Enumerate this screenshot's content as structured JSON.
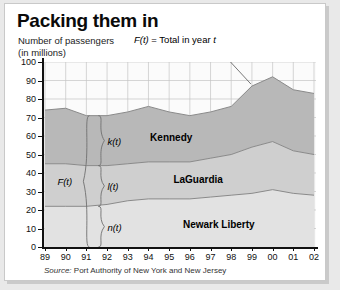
{
  "card": {
    "title": "Packing them in",
    "subtitle_line1": "Number of passengers",
    "subtitle_line2": "(in millions)",
    "callout": "= Total in year",
    "callout_fn": "F(t)",
    "callout_var": "t",
    "source_prefix": "Source:",
    "source_text": "Port Authority of New York and New Jersey"
  },
  "annotations": {
    "brace_total": "F(t)",
    "brace_kennedy": "k(t)",
    "brace_laguardia": "l(t)",
    "brace_newark": "n(t)"
  },
  "colors": {
    "kennedy": "#b8b8b8",
    "laguardia": "#cfcfcf",
    "newark": "#e2e2e2",
    "curve": "#8a8a8a",
    "grid": "#c4c4c4",
    "axis": "#111111",
    "card_bg": "#ffffff",
    "page_bg": "#e9e9e9"
  },
  "chart_data": {
    "type": "area",
    "stacked": true,
    "title": "Packing them in",
    "xlabel": "",
    "ylabel": "Number of passengers (in millions)",
    "ylim": [
      0,
      100
    ],
    "yticks": [
      0,
      10,
      20,
      30,
      40,
      50,
      60,
      70,
      80,
      90,
      100
    ],
    "grid": true,
    "legend_position": "inline-area-labels",
    "categories": [
      "89",
      "90",
      "91",
      "92",
      "93",
      "94",
      "95",
      "96",
      "97",
      "98",
      "99",
      "00",
      "01",
      "02"
    ],
    "series": [
      {
        "name": "Newark Liberty",
        "fn": "n(t)",
        "color": "#e2e2e2",
        "values": [
          22,
          22,
          22,
          23,
          25,
          26,
          26,
          26,
          27,
          28,
          29,
          31,
          29,
          28
        ]
      },
      {
        "name": "LaGuardia",
        "fn": "l(t)",
        "color": "#cfcfcf",
        "values": [
          23,
          23,
          22,
          21,
          20,
          20,
          20,
          20,
          21,
          22,
          25,
          26,
          23,
          22
        ]
      },
      {
        "name": "Kennedy",
        "fn": "k(t)",
        "color": "#b8b8b8",
        "values": [
          29,
          30,
          27,
          27,
          28,
          30,
          27,
          25,
          25,
          26,
          33,
          35,
          33,
          33
        ]
      }
    ],
    "totals": [
      74,
      75,
      71,
      71,
      73,
      76,
      73,
      71,
      73,
      76,
      87,
      92,
      85,
      83
    ],
    "total_fn": "F(t)",
    "annotation_year": "91"
  }
}
